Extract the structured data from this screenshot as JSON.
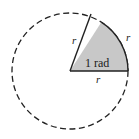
{
  "diagram": {
    "center": [
      70,
      71
    ],
    "radius": 58,
    "sector_angle_rad": 1,
    "labels": {
      "sector": "1 rad",
      "radius_top": "r",
      "arc": "r",
      "radius_bottom": "r"
    },
    "colors": {
      "sector_fill": "#c8c8c8",
      "stroke": "#222222",
      "background": "#ffffff"
    }
  }
}
